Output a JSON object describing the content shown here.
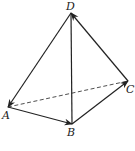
{
  "figure": {
    "type": "tetrahedron",
    "vertices": {
      "A": {
        "label": "A",
        "x": 8,
        "y": 107,
        "lx": 2,
        "ly": 119
      },
      "B": {
        "label": "B",
        "x": 72,
        "y": 124,
        "lx": 67,
        "ly": 136
      },
      "C": {
        "label": "C",
        "x": 128,
        "y": 81,
        "lx": 126,
        "ly": 93
      },
      "D": {
        "label": "D",
        "x": 71,
        "y": 13,
        "lx": 66,
        "ly": 10
      }
    },
    "edges": [
      {
        "from": "D",
        "to": "A",
        "style": "solid",
        "arrow": "end"
      },
      {
        "from": "A",
        "to": "B",
        "style": "solid",
        "arrow": "end"
      },
      {
        "from": "B",
        "to": "C",
        "style": "solid",
        "arrow": "end"
      },
      {
        "from": "C",
        "to": "D",
        "style": "solid",
        "arrow": "end"
      },
      {
        "from": "D",
        "to": "B",
        "style": "solid",
        "arrow": "none"
      },
      {
        "from": "A",
        "to": "C",
        "style": "dashed",
        "arrow": "none"
      }
    ],
    "stroke_color": "#222222"
  }
}
